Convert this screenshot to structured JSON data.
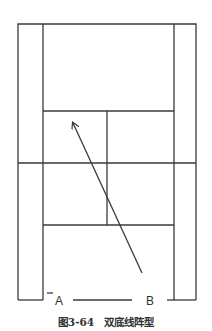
{
  "diagram": {
    "type": "badminton-court-formation",
    "labels": {
      "player_a": "A",
      "player_b": "B"
    },
    "caption": "图3-64　双底线阵型",
    "colors": {
      "line": "#3a3a3a",
      "background": "#ffffff"
    }
  }
}
